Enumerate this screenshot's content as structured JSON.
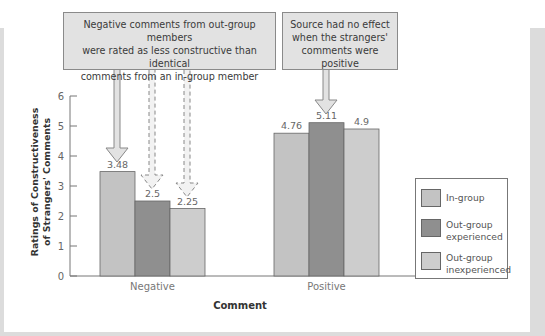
{
  "chart_data": {
    "type": "bar",
    "title": "",
    "xlabel": "Comment",
    "ylabel": "Ratings of Constructiveness of Strangers' Comments",
    "ylabel_lines": [
      "Ratings of Constructiveness",
      "of Strangers' Comments"
    ],
    "ylim": [
      0,
      6
    ],
    "yticks": [
      "0",
      "1",
      "2",
      "3",
      "4",
      "5",
      "6"
    ],
    "categories": [
      "Negative",
      "Positive"
    ],
    "series": [
      {
        "name": "In-group",
        "values": [
          3.48,
          4.76
        ],
        "labels": [
          "3.48",
          "4.76"
        ],
        "color": "#c3c3c3"
      },
      {
        "name": "Out-group experienced",
        "values": [
          2.5,
          5.11
        ],
        "labels": [
          "2.5",
          "5.11"
        ],
        "color": "#8f8f8f"
      },
      {
        "name": "Out-group inexperienced",
        "values": [
          2.25,
          4.9
        ],
        "labels": [
          "2.25",
          "4.9"
        ],
        "color": "#cdcdcd"
      }
    ],
    "legend": {
      "position": "right",
      "items": [
        {
          "line1": "In-group",
          "line2": ""
        },
        {
          "line1": "Out-group",
          "line2": "experienced"
        },
        {
          "line1": "Out-group",
          "line2": "inexperienced"
        }
      ]
    },
    "grid": false,
    "annotations": [
      {
        "lines": [
          "Negative comments from out-group members",
          "were rated as less constructive than identical",
          "comments from an in-group member"
        ],
        "points_to": "Negative bars"
      },
      {
        "lines": [
          "Source had no effect",
          "when the strangers'",
          "comments were positive"
        ],
        "points_to": "Positive, Out-group experienced bar"
      }
    ]
  },
  "colors": {
    "callout_fill": "#e2e2e2",
    "frame_gray": "#dcdcdc",
    "axis": "#777777"
  }
}
